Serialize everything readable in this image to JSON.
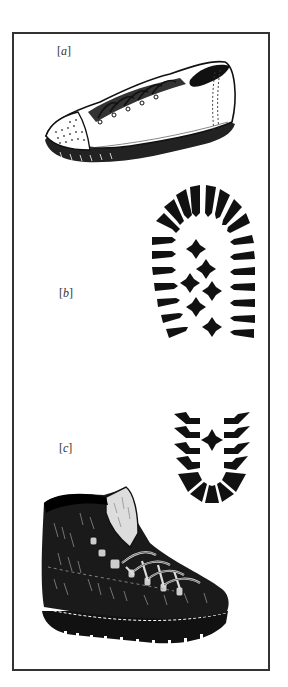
{
  "figure": {
    "panels": [
      {
        "id": "a",
        "label": "[a]",
        "letter": "a",
        "bracket_open": "[",
        "bracket_close": "]",
        "subject": "low-cut canvas sneaker with laces and rubber toe cap"
      },
      {
        "id": "b",
        "label": "[b]",
        "letter": "b",
        "bracket_open": "[",
        "bracket_close": "]",
        "subject": "lugged sole tread pattern (large)"
      },
      {
        "id": "c",
        "label": "[c]",
        "letter": "c",
        "bracket_open": "[",
        "bracket_close": "]",
        "subject": "hiking boot with heel tread pattern"
      }
    ],
    "colors": {
      "ink": "#111111",
      "frame": "#333333",
      "paper": "#ffffff"
    }
  }
}
